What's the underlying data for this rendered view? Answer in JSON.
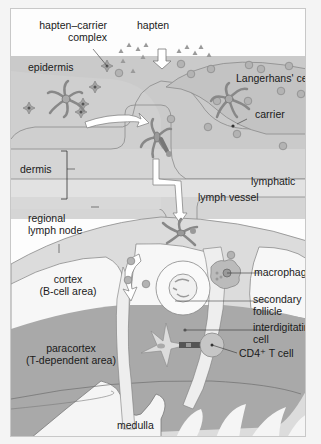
{
  "figure": {
    "labels": {
      "hapten_carrier_complex_line1": "hapten–carrier",
      "hapten_carrier_complex_line2": "complex",
      "hapten": "hapten",
      "epidermis": "epidermis",
      "langerhans_cell": "Langerhans' cell",
      "carrier": "carrier",
      "dermis": "dermis",
      "lymphatic": "lymphatic",
      "lymph_vessel": "lymph vessel",
      "regional_line1": "regional",
      "regional_line2": "lymph node",
      "cortex_line1": "cortex",
      "cortex_line2": "(B-cell area)",
      "macrophage": "macrophage",
      "secondary_line1": "secondary",
      "secondary_line2": "follicle",
      "interdigitating_line1": "interdigitating",
      "interdigitating_line2": "cell",
      "cd4_t_cell": "CD4⁺ T cell",
      "paracortex_line1": "paracortex",
      "paracortex_line2": "(T-dependent area)",
      "medulla": "medulla"
    },
    "colors": {
      "epidermis": "#c9c9c9",
      "dermis": "#d6d6d6",
      "lymphatic": "#e4e4e4",
      "paracortex": "#a9a9a9",
      "cortex": "#f7f7f7",
      "cell": "#bdbdbd",
      "stroke": "#7a7a7a",
      "arrow": "#ffffff"
    }
  }
}
